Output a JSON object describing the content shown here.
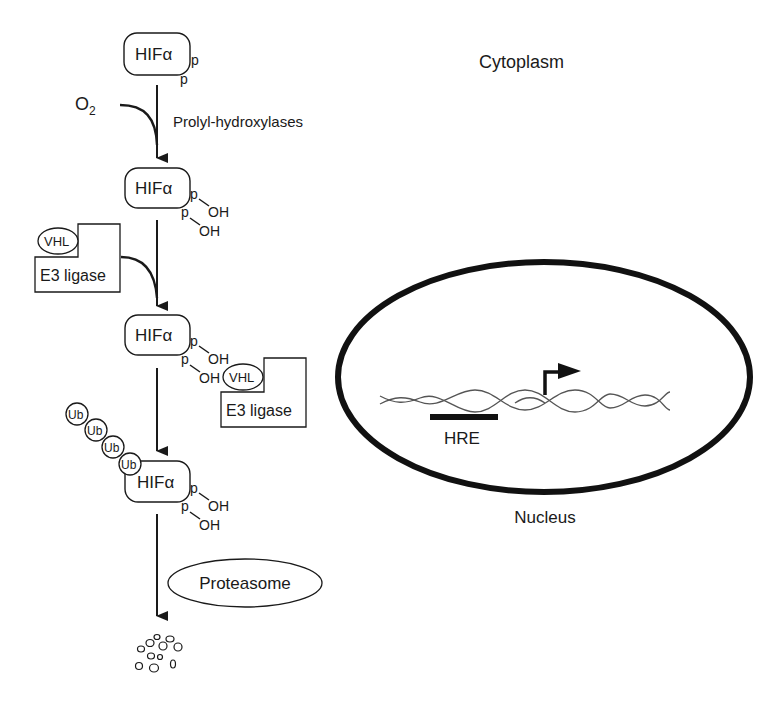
{
  "regions": {
    "cytoplasm_label": "Cytoplasm",
    "nucleus_label": "Nucleus"
  },
  "pathway": {
    "hif_label": "HIFα",
    "p_label": "p",
    "oh_label": "OH",
    "oxygen": {
      "base": "O",
      "subscript": "2"
    },
    "enzyme_label": "Prolyl-hydroxylases",
    "vhl_label": "VHL",
    "e3_label": "E3 ligase",
    "ub_label": "Ub",
    "ub_count": 4,
    "proteasome_label": "Proteasome"
  },
  "nucleus": {
    "hre_label": "HRE",
    "transcription_start": "arrow-right-icon"
  },
  "colors": {
    "ink": "#1a1a1a",
    "dna": "#555555",
    "background": "#ffffff"
  }
}
